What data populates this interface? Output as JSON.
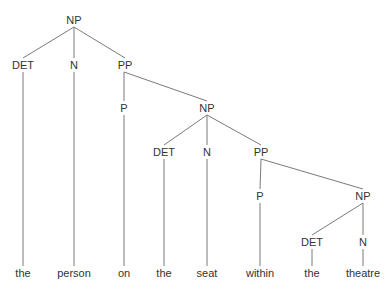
{
  "diagram": {
    "type": "syntax-tree",
    "line_color": "#7a7a7a",
    "text_color": "#333333",
    "nodes": [
      {
        "id": "np1",
        "label": "NP",
        "x": 74,
        "y": 20
      },
      {
        "id": "det1",
        "label": "DET",
        "x": 23,
        "y": 65
      },
      {
        "id": "n1",
        "label": "N",
        "x": 74,
        "y": 65
      },
      {
        "id": "pp1",
        "label": "PP",
        "x": 125,
        "y": 65
      },
      {
        "id": "p1",
        "label": "P",
        "x": 124,
        "y": 108
      },
      {
        "id": "np2",
        "label": "NP",
        "x": 207,
        "y": 108
      },
      {
        "id": "det2",
        "label": "DET",
        "x": 164,
        "y": 152
      },
      {
        "id": "n2",
        "label": "N",
        "x": 207,
        "y": 152
      },
      {
        "id": "pp2",
        "label": "PP",
        "x": 261,
        "y": 152
      },
      {
        "id": "p2",
        "label": "P",
        "x": 260,
        "y": 196
      },
      {
        "id": "np3",
        "label": "NP",
        "x": 363,
        "y": 196
      },
      {
        "id": "det3",
        "label": "DET",
        "x": 312,
        "y": 242
      },
      {
        "id": "n3",
        "label": "N",
        "x": 363,
        "y": 242
      }
    ],
    "words": [
      {
        "text": "the",
        "x": 23,
        "y": 273
      },
      {
        "text": "person",
        "x": 74,
        "y": 273
      },
      {
        "text": "on",
        "x": 124,
        "y": 273
      },
      {
        "text": "the",
        "x": 164,
        "y": 273
      },
      {
        "text": "seat",
        "x": 207,
        "y": 273
      },
      {
        "text": "within",
        "x": 260,
        "y": 273
      },
      {
        "text": "the",
        "x": 312,
        "y": 273
      },
      {
        "text": "theatre",
        "x": 363,
        "y": 273
      }
    ],
    "edges": [
      [
        74,
        27,
        23,
        58
      ],
      [
        74,
        27,
        74,
        58
      ],
      [
        74,
        27,
        125,
        58
      ],
      [
        23,
        72,
        23,
        266
      ],
      [
        74,
        72,
        74,
        266
      ],
      [
        124,
        72,
        124,
        101
      ],
      [
        124,
        72,
        207,
        101
      ],
      [
        124,
        115,
        124,
        266
      ],
      [
        207,
        115,
        164,
        145
      ],
      [
        207,
        115,
        207,
        145
      ],
      [
        207,
        115,
        261,
        145
      ],
      [
        164,
        159,
        164,
        266
      ],
      [
        207,
        159,
        207,
        266
      ],
      [
        261,
        159,
        260,
        189
      ],
      [
        261,
        159,
        363,
        189
      ],
      [
        260,
        203,
        260,
        266
      ],
      [
        363,
        203,
        312,
        235
      ],
      [
        363,
        203,
        363,
        235
      ],
      [
        312,
        249,
        312,
        266
      ],
      [
        363,
        249,
        363,
        266
      ]
    ]
  }
}
